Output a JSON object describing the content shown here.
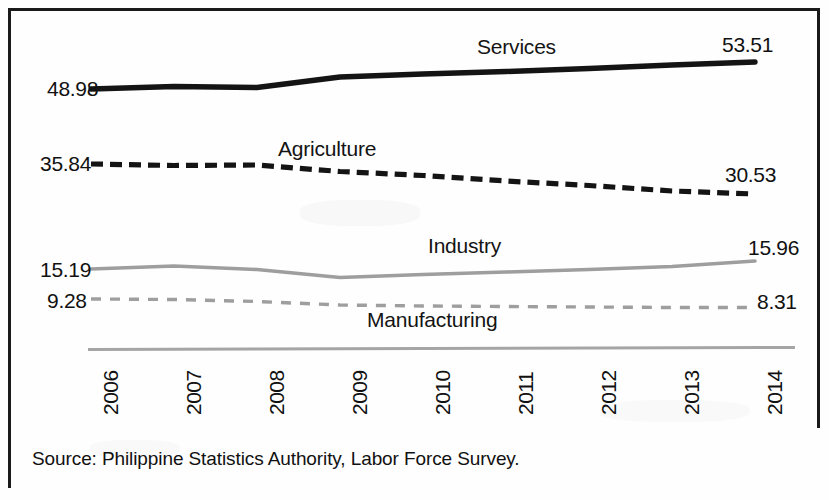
{
  "figure": {
    "source_note": "Source: Philippine Statistics Authority,  Labor Force Survey."
  },
  "chart_data": {
    "type": "line",
    "title": "",
    "subtitle": "",
    "xlabel": "",
    "ylabel": "",
    "grid": false,
    "legend_position": "inline-labels",
    "x": [
      "2006",
      "2007",
      "2008",
      "2009",
      "2010",
      "2011",
      "2012",
      "2013",
      "2014"
    ],
    "categories": [
      "2006",
      "2007",
      "2008",
      "2009",
      "2010",
      "2011",
      "2012",
      "2013",
      "2014"
    ],
    "ylim": [
      0,
      60
    ],
    "units": "percent share of total employment",
    "series": [
      {
        "name": "Services",
        "style": "solid-thick-black",
        "color": "#111111",
        "values": [
          48.98,
          49.35,
          49.18,
          50.85,
          51.25,
          51.65,
          52.23,
          52.85,
          53.51
        ],
        "start_value": "48.98",
        "end_value": "53.51"
      },
      {
        "name": "Agriculture",
        "style": "dashed-thick-black",
        "color": "#111111",
        "values": [
          35.84,
          35.61,
          35.65,
          34.58,
          33.95,
          33.04,
          32.25,
          31.24,
          30.53
        ],
        "start_value": "35.84",
        "end_value": "30.53"
      },
      {
        "name": "Industry",
        "style": "solid-thin-gray",
        "color": "#9a9a9a",
        "values": [
          15.19,
          15.38,
          15.17,
          14.57,
          14.8,
          15.0,
          15.18,
          15.42,
          15.96
        ],
        "start_value": "15.19",
        "end_value": "15.96"
      },
      {
        "name": "Manufacturing",
        "style": "dashed-thin-gray",
        "color": "#9a9a9a",
        "values": [
          9.28,
          9.24,
          9.01,
          8.58,
          8.46,
          8.42,
          8.35,
          8.3,
          8.31
        ],
        "start_value": "9.28",
        "end_value": "8.31"
      }
    ],
    "axis_labels": {
      "services_start": "48.98",
      "services_end": "53.51",
      "agriculture_start": "35.84",
      "agriculture_end": "30.53",
      "industry_start": "15.19",
      "industry_end": "15.96",
      "manufacturing_start": "9.28",
      "manufacturing_end": "8.31"
    },
    "series_names": {
      "services": "Services",
      "agriculture": "Agriculture",
      "industry": "Industry",
      "manufacturing": "Manufacturing"
    }
  }
}
